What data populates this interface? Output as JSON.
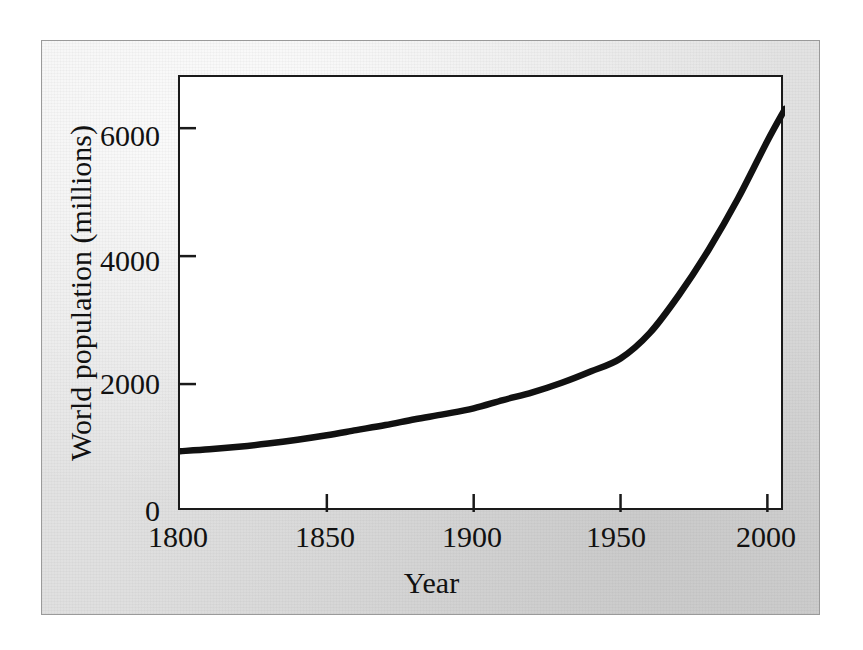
{
  "figure": {
    "background_color": "#ffffff",
    "plate_border_color": "#9a9a9a",
    "plot_border_color": "#1a1a1a",
    "curve_color": "#111111"
  },
  "chart_data": {
    "type": "line",
    "title": "",
    "xlabel": "Year",
    "ylabel": "World population (millions)",
    "xlim": [
      1800,
      2006
    ],
    "ylim": [
      0,
      6800
    ],
    "xticks": [
      1800,
      1850,
      1900,
      1950,
      2000
    ],
    "xticklabels": [
      "1800",
      "1850",
      "1900",
      "1950",
      "2000"
    ],
    "yticks": [
      0,
      2000,
      4000,
      6000
    ],
    "yticklabels": [
      "0",
      "2000",
      "4000",
      "6000"
    ],
    "grid": false,
    "legend": null,
    "series": [
      {
        "name": "World population",
        "x": [
          1800,
          1810,
          1820,
          1830,
          1840,
          1850,
          1860,
          1870,
          1880,
          1890,
          1900,
          1910,
          1920,
          1930,
          1940,
          1950,
          1960,
          1970,
          1980,
          1990,
          2000,
          2006
        ],
        "values": [
          950,
          980,
          1020,
          1070,
          1130,
          1200,
          1280,
          1360,
          1450,
          1530,
          1620,
          1750,
          1870,
          2020,
          2200,
          2400,
          2800,
          3400,
          4100,
          4900,
          5800,
          6300
        ]
      }
    ],
    "annotations": []
  },
  "axes": {
    "y_ticks": [
      {
        "label": "6000",
        "value": 6000
      },
      {
        "label": "4000",
        "value": 4000
      },
      {
        "label": "2000",
        "value": 2000
      },
      {
        "label": "0",
        "value": 0
      }
    ],
    "x_ticks": [
      {
        "label": "1800",
        "value": 1800
      },
      {
        "label": "1850",
        "value": 1850
      },
      {
        "label": "1900",
        "value": 1900
      },
      {
        "label": "1950",
        "value": 1950
      },
      {
        "label": "2000",
        "value": 2000
      }
    ]
  }
}
